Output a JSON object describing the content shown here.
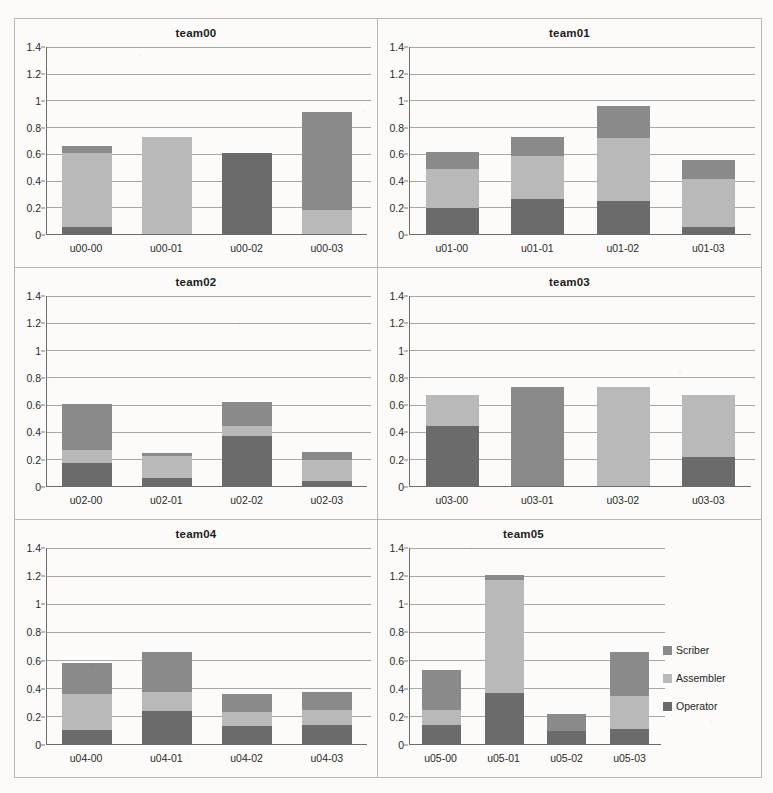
{
  "legend": {
    "position": "right-middle",
    "entries": [
      {
        "label": "Scriber",
        "color": "#8a8a8a"
      },
      {
        "label": "Assembler",
        "color": "#b9b9b9"
      },
      {
        "label": "Operator",
        "color": "#6b6b6b"
      }
    ]
  },
  "axis": {
    "ylim": [
      0,
      1.4
    ],
    "yticks": [
      "0",
      "0.2",
      "0.4",
      "0.6",
      "0.8",
      "1",
      "1.2",
      "1.4"
    ],
    "ytick_values": [
      0,
      0.2,
      0.4,
      0.6,
      0.8,
      1.0,
      1.2,
      1.4
    ],
    "grid": true,
    "ylabel": "",
    "xlabel": ""
  },
  "chart_data": [
    {
      "type": "bar",
      "title": "team00",
      "categories": [
        "u00-00",
        "u00-01",
        "u00-02",
        "u00-03"
      ],
      "series": [
        {
          "name": "Operator",
          "values": [
            0.08,
            0.0,
            0.92,
            0.0
          ]
        },
        {
          "name": "Assembler",
          "values": [
            0.81,
            1.01,
            0.0,
            0.22
          ]
        },
        {
          "name": "Scriber",
          "values": [
            0.07,
            0.0,
            0.0,
            0.91
          ]
        }
      ],
      "totals": [
        0.96,
        1.01,
        0.92,
        1.13
      ],
      "stacked": true,
      "ylim": [
        0,
        1.4
      ],
      "xlabel": "",
      "ylabel": ""
    },
    {
      "type": "bar",
      "title": "team01",
      "categories": [
        "u01-00",
        "u01-01",
        "u01-02",
        "u01-03"
      ],
      "series": [
        {
          "name": "Operator",
          "values": [
            0.29,
            0.36,
            0.3,
            0.08
          ]
        },
        {
          "name": "Assembler",
          "values": [
            0.44,
            0.45,
            0.57,
            0.57
          ]
        },
        {
          "name": "Scriber",
          "values": [
            0.2,
            0.2,
            0.29,
            0.23
          ]
        }
      ],
      "totals": [
        0.93,
        1.01,
        1.16,
        0.88
      ],
      "stacked": true,
      "ylim": [
        0,
        1.4
      ],
      "xlabel": "",
      "ylabel": ""
    },
    {
      "type": "bar",
      "title": "team02",
      "categories": [
        "u02-00",
        "u02-01",
        "u02-02",
        "u02-03"
      ],
      "series": [
        {
          "name": "Operator",
          "values": [
            0.26,
            0.14,
            0.55,
            0.08
          ]
        },
        {
          "name": "Assembler",
          "values": [
            0.14,
            0.4,
            0.12,
            0.38
          ]
        },
        {
          "name": "Scriber",
          "values": [
            0.52,
            0.04,
            0.26,
            0.13
          ]
        }
      ],
      "totals": [
        0.92,
        0.58,
        0.93,
        0.59
      ],
      "stacked": true,
      "ylim": [
        0,
        1.4
      ],
      "xlabel": "",
      "ylabel": ""
    },
    {
      "type": "bar",
      "title": "team03",
      "categories": [
        "u03-00",
        "u03-01",
        "u03-02",
        "u03-03"
      ],
      "series": [
        {
          "name": "Operator",
          "values": [
            0.64,
            0.0,
            0.0,
            0.31
          ]
        },
        {
          "name": "Assembler",
          "values": [
            0.33,
            0.0,
            1.01,
            0.66
          ]
        },
        {
          "name": "Scriber",
          "values": [
            0.0,
            1.01,
            0.0,
            0.0
          ]
        }
      ],
      "totals": [
        0.97,
        1.01,
        1.01,
        0.97
      ],
      "stacked": true,
      "ylim": [
        0,
        1.4
      ],
      "xlabel": "",
      "ylabel": ""
    },
    {
      "type": "bar",
      "title": "team04",
      "categories": [
        "u04-00",
        "u04-01",
        "u04-02",
        "u04-03"
      ],
      "series": [
        {
          "name": "Operator",
          "values": [
            0.16,
            0.34,
            0.26,
            0.27
          ]
        },
        {
          "name": "Assembler",
          "values": [
            0.4,
            0.2,
            0.19,
            0.2
          ]
        },
        {
          "name": "Scriber",
          "values": [
            0.34,
            0.42,
            0.26,
            0.25
          ]
        }
      ],
      "totals": [
        0.9,
        0.96,
        0.71,
        0.72
      ],
      "stacked": true,
      "ylim": [
        0,
        1.4
      ],
      "xlabel": "",
      "ylabel": ""
    },
    {
      "type": "bar",
      "title": "team05",
      "categories": [
        "u05-00",
        "u05-01",
        "u05-02",
        "u05-03"
      ],
      "series": [
        {
          "name": "Operator",
          "values": [
            0.22,
            0.39,
            0.23,
            0.16
          ]
        },
        {
          "name": "Assembler",
          "values": [
            0.18,
            0.87,
            0.0,
            0.34
          ]
        },
        {
          "name": "Scriber",
          "values": [
            0.46,
            0.04,
            0.32,
            0.46
          ]
        }
      ],
      "totals": [
        0.86,
        1.3,
        0.55,
        0.96
      ],
      "stacked": true,
      "ylim": [
        0,
        1.4
      ],
      "xlabel": "",
      "ylabel": ""
    }
  ]
}
